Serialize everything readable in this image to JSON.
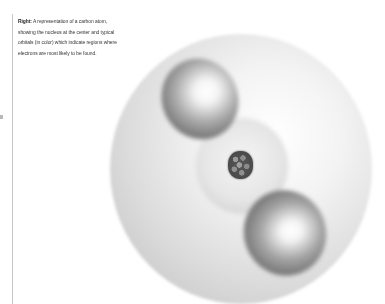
{
  "caption": {
    "lead": "Right:",
    "lines": [
      " A representation of a carbon atom,",
      "showing the nucleus at the center and typical",
      "orbitals (in color) which indicate regions where",
      "electrons are most likely to be found."
    ]
  },
  "figure": {
    "subject": "carbon atom",
    "parts": [
      "electron-cloud-shell",
      "orbital-lobe-top",
      "orbital-lobe-bottom",
      "nucleus"
    ]
  }
}
